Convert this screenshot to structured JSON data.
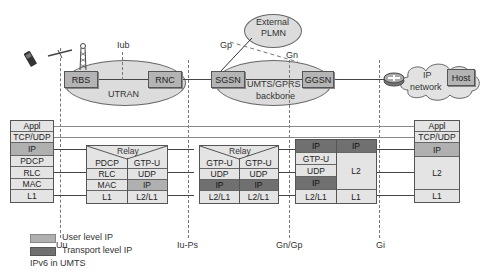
{
  "network": {
    "iub_label": "Iub",
    "utran_label": "UTRAN",
    "rbs": "RBS",
    "rnc": "RNC",
    "sgsn": "SGSN",
    "ggsn": "GGSN",
    "backbone_line1": "UMTS/GPRS",
    "backbone_line2": "backbone",
    "external_line1": "External",
    "external_line2": "PLMN",
    "gp_label": "Gp",
    "gn_label": "Gn",
    "ip_network_line1": "IP",
    "ip_network_line2": "network",
    "host": "Host"
  },
  "stacks": {
    "ue": [
      "Appl",
      "TCP/UDP",
      "IP",
      "PDCP",
      "RLC",
      "MAC",
      "L1"
    ],
    "rnc": {
      "relay": "Relay",
      "left": [
        "PDCP",
        "RLC",
        "MAC",
        "L1"
      ],
      "right": [
        "GTP-U",
        "UDP",
        "IP",
        "L2/L1"
      ]
    },
    "sgsn": {
      "relay": "Relay",
      "left": [
        "GTP-U",
        "UDP",
        "IP",
        "L2/L1"
      ],
      "right": [
        "GTP-U",
        "UDP",
        "IP",
        "L2/L1"
      ]
    },
    "ggsn": {
      "left": [
        "IP",
        "GTP-U",
        "UDP",
        "IP",
        "L2/L1"
      ],
      "right": [
        "IP",
        "L2",
        "L1"
      ]
    },
    "host": [
      "Appl",
      "TCP/UDP",
      "IP",
      "L2",
      "L1"
    ]
  },
  "interfaces": [
    "Uu",
    "Iu-Ps",
    "Gn/Gp",
    "Gi"
  ],
  "legend": {
    "user_level": "User level IP",
    "transport_level": "Transport level IP",
    "caption": "IPv6 in UMTS"
  },
  "colors": {
    "user_level_ip": "#b0b0b0",
    "transport_level_ip": "#707070",
    "cell": "#e4e4e4",
    "node": "#b4b4b4"
  }
}
